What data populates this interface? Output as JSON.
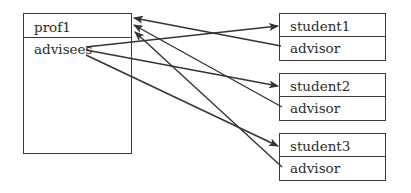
{
  "diagram": {
    "professor": {
      "name": "prof1",
      "field": "advisees"
    },
    "students": [
      {
        "name": "student1",
        "field": "advisor"
      },
      {
        "name": "student2",
        "field": "advisor"
      },
      {
        "name": "student3",
        "field": "advisor"
      }
    ],
    "edges": [
      {
        "from": "prof1.advisees",
        "to": "student1"
      },
      {
        "from": "prof1.advisees",
        "to": "student2"
      },
      {
        "from": "prof1.advisees",
        "to": "student3"
      },
      {
        "from": "student1.advisor",
        "to": "prof1"
      },
      {
        "from": "student2.advisor",
        "to": "prof1"
      },
      {
        "from": "student3.advisor",
        "to": "prof1"
      }
    ],
    "colors": {
      "line": "#3a3a3a",
      "text": "#2b2b2b",
      "background": "#ffffff"
    }
  }
}
